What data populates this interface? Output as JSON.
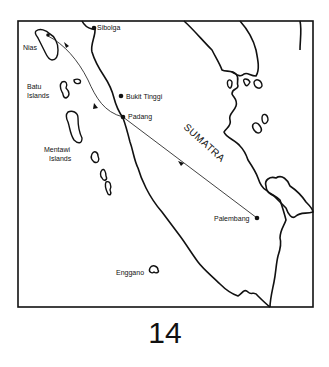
{
  "map": {
    "region": "SUMATRA",
    "page_number": "14",
    "cities": [
      {
        "name": "Sibolga",
        "x": 94,
        "y": 28
      },
      {
        "name": "Bukit Tinggi",
        "x": 121,
        "y": 96
      },
      {
        "name": "Padang",
        "x": 123,
        "y": 117
      },
      {
        "name": "Palembang",
        "x": 257,
        "y": 218
      }
    ],
    "islands": [
      {
        "name": "Nias"
      },
      {
        "name": "Batu\nIslands",
        "line1": "Batu",
        "line2": "Islands"
      },
      {
        "name": "Mentawi Islands",
        "line1": "Mentawi",
        "line2": "Islands"
      },
      {
        "name": "Enggano"
      }
    ],
    "route": [
      "Nias",
      "Padang",
      "Palembang"
    ],
    "colors": {
      "ink": "#111111",
      "paper": "#ffffff"
    }
  }
}
